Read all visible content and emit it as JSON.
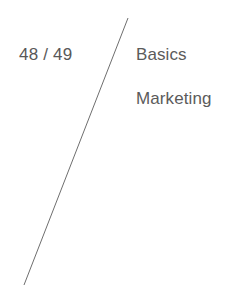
{
  "page": {
    "background_color": "#ffffff",
    "width": 248,
    "height": 285
  },
  "page_number": {
    "label": "48 / 49",
    "current": "48",
    "separator": "/",
    "total": "49",
    "color": "#585858"
  },
  "divider": {
    "icon_name": "diagonal-rule",
    "color": "#6e6e6e",
    "stroke_width": 1,
    "x1": 128,
    "y1": 18,
    "x2": 24,
    "y2": 285
  },
  "sections": [
    {
      "label": "Basics"
    },
    {
      "label": "Marketing"
    }
  ]
}
